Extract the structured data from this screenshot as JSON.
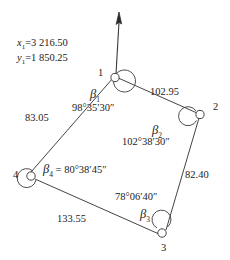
{
  "figure": {
    "line_color": "#3a3a3a",
    "text_color": "#222222",
    "background": "#ffffff"
  },
  "north_arrow": {
    "name": "north-direction-arrow",
    "label": ""
  },
  "coordinates": {
    "x_symbol": "x",
    "x_subscript": "1",
    "x_equals": "=",
    "x_value": "3 216.50",
    "y_symbol": "y",
    "y_subscript": "1",
    "y_equals": "=",
    "y_value": "1 850.25"
  },
  "stations": [
    {
      "id": "1",
      "label": "1",
      "x": 113,
      "y": 75
    },
    {
      "id": "2",
      "label": "2",
      "x": 200,
      "y": 113
    },
    {
      "id": "3",
      "label": "3",
      "x": 163,
      "y": 233
    },
    {
      "id": "4",
      "label": "4",
      "x": 32,
      "y": 176
    }
  ],
  "angles": [
    {
      "id": "beta1",
      "symbol": "β",
      "subscript": "1",
      "value": "98°35′30″",
      "station": "1"
    },
    {
      "id": "beta2",
      "symbol": "β",
      "subscript": "2",
      "value": "102°38′30″",
      "station": "2"
    },
    {
      "id": "beta3",
      "symbol": "β",
      "subscript": "3",
      "value": "78°06′40″",
      "station": "3"
    },
    {
      "id": "beta4",
      "symbol": "β",
      "subscript": "4",
      "equals": "=",
      "value": "80°38′45″",
      "station": "4"
    }
  ],
  "sides": [
    {
      "id": "side-1-2",
      "from": "1",
      "to": "2",
      "length": "102.95"
    },
    {
      "id": "side-2-3",
      "from": "2",
      "to": "3",
      "length": "82.40"
    },
    {
      "id": "side-3-4",
      "from": "3",
      "to": "4",
      "length": "133.55"
    },
    {
      "id": "side-4-1",
      "from": "4",
      "to": "1",
      "length": "83.05"
    }
  ]
}
